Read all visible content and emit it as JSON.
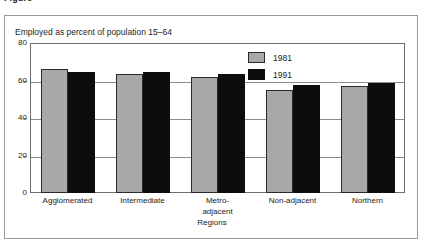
{
  "figure": {
    "caption_label": "Figure",
    "caption_number": "",
    "caption_text": ""
  },
  "chart_data": {
    "type": "bar",
    "title": "Employed as percent of population 15–64",
    "subtitle": "Employed as percent of population 15–64",
    "xlabel": "Regions",
    "ylabel": "",
    "categories": [
      "Agglomerated",
      "Intermediate",
      "Metro-\nadjacent",
      "Non-adjacent",
      "Northern"
    ],
    "series": [
      {
        "name": "1981",
        "color": "#a8a8a8",
        "values": [
          66,
          63.5,
          62,
          55,
          57
        ]
      },
      {
        "name": "1991",
        "color": "#0d0d0d",
        "values": [
          64.5,
          64.5,
          63.5,
          57.5,
          58.5
        ]
      }
    ],
    "ylim": [
      0,
      80
    ],
    "yticks": [
      0,
      20,
      40,
      60,
      80
    ],
    "ytick_labels": [
      "0",
      "20",
      "40",
      "60",
      "80"
    ],
    "grid": true,
    "legend_position": "top-right"
  }
}
